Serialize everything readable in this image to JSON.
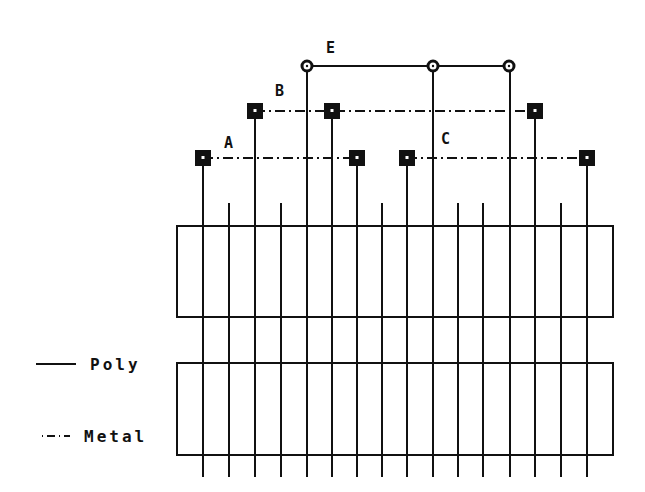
{
  "diagram": {
    "type": "layout-routing",
    "colors": {
      "ink": "#111111",
      "background": "#ffffff"
    },
    "net_labels": [
      {
        "id": "E",
        "text": "E",
        "x": 331,
        "y": 53
      },
      {
        "id": "B",
        "text": "B",
        "x": 280,
        "y": 95
      },
      {
        "id": "A",
        "text": "A",
        "x": 229,
        "y": 147
      },
      {
        "id": "C",
        "text": "C",
        "x": 446,
        "y": 143
      }
    ],
    "legend": [
      {
        "id": "poly",
        "text": "Poly",
        "style": "solid"
      },
      {
        "id": "metal",
        "text": "Metal",
        "style": "dash-dot"
      }
    ],
    "poly_columns_x": [
      203,
      229,
      255,
      281,
      307,
      332,
      357,
      382,
      407,
      433,
      458,
      483,
      510,
      535,
      561,
      587
    ],
    "tall_columns": {
      "203": 158,
      "255": 111,
      "307": 66,
      "332": 111,
      "357": 158,
      "407": 158,
      "433": 66,
      "509": 66,
      "535": 111,
      "587": 158
    },
    "short_column_top_y": 203,
    "column_bottom_y": 477,
    "diffusion_rects": [
      {
        "x": 177,
        "y": 226,
        "w": 436,
        "h": 91
      },
      {
        "x": 177,
        "y": 363,
        "w": 436,
        "h": 92
      }
    ],
    "nets": [
      {
        "name": "E",
        "layer": "poly",
        "y": 66,
        "x1": 307,
        "x2": 509,
        "contacts": [
          307,
          433,
          509
        ],
        "contact_shape": "circle"
      },
      {
        "name": "B",
        "layer": "metal",
        "y": 111,
        "x1": 255,
        "x2": 535,
        "contacts": [
          255,
          332,
          535
        ],
        "contact_shape": "square"
      },
      {
        "name": "A",
        "layer": "metal",
        "y": 158,
        "x1": 203,
        "x2": 357,
        "contacts": [
          203,
          357
        ],
        "contact_shape": "square"
      },
      {
        "name": "C",
        "layer": "metal",
        "y": 158,
        "x1": 407,
        "x2": 587,
        "contacts": [
          407,
          587
        ],
        "contact_shape": "square"
      }
    ]
  }
}
